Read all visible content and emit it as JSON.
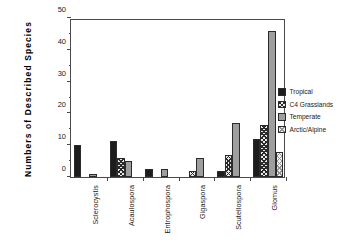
{
  "chart_data": {
    "type": "bar",
    "title": "",
    "xlabel": "",
    "ylabel": "Numbers of Described Species",
    "ylim": [
      0,
      50
    ],
    "yticks": [
      0,
      10,
      20,
      30,
      40,
      50
    ],
    "ytick_labels": [
      "0",
      "10",
      "20",
      "30",
      "40",
      "50"
    ],
    "minor_yticks": [
      5,
      15,
      25,
      35,
      45
    ],
    "grid": false,
    "legend_position": "right",
    "categories": [
      "Sclerocystis",
      "Acaulospora",
      "Entrophospora",
      "Gigaspora",
      "Scutellospora",
      "Glomus"
    ],
    "series": [
      {
        "name": "Tropical",
        "color": "#1c1c1c",
        "pattern": "solid",
        "values": [
          10.2,
          11.4,
          2.4,
          0,
          2.0,
          12.0
        ]
      },
      {
        "name": "C4 Grasslands",
        "color": "#2a2a2a",
        "pattern": "crosshatch-dark",
        "values": [
          0,
          6.0,
          0,
          2.0,
          6.8,
          16.4
        ]
      },
      {
        "name": "Temperate",
        "color": "#9e9e9e",
        "pattern": "solid-gray",
        "values": [
          1.0,
          5.1,
          2.4,
          6.0,
          17.0,
          46.0
        ]
      },
      {
        "name": "Arctic/Alpine",
        "color": "#909090",
        "pattern": "crosshatch-light",
        "values": [
          0,
          0,
          0,
          0,
          0,
          8.0
        ]
      }
    ]
  }
}
